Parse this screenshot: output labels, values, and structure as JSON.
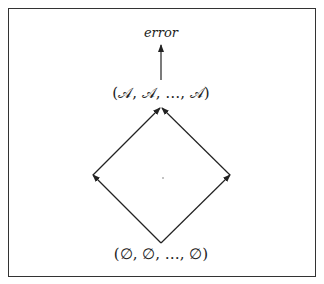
{
  "diagram": {
    "type": "lattice",
    "nodes": {
      "error": {
        "label": "error"
      },
      "top": {
        "label": "(𝒜, 𝒜, …, 𝒜)"
      },
      "left": {
        "label": ""
      },
      "right": {
        "label": ""
      },
      "bottom": {
        "label": "(∅, ∅, …, ∅)"
      }
    },
    "edges": [
      {
        "from": "bottom",
        "to": "left"
      },
      {
        "from": "bottom",
        "to": "right"
      },
      {
        "from": "left",
        "to": "top"
      },
      {
        "from": "right",
        "to": "top"
      },
      {
        "from": "top",
        "to": "error"
      }
    ]
  }
}
